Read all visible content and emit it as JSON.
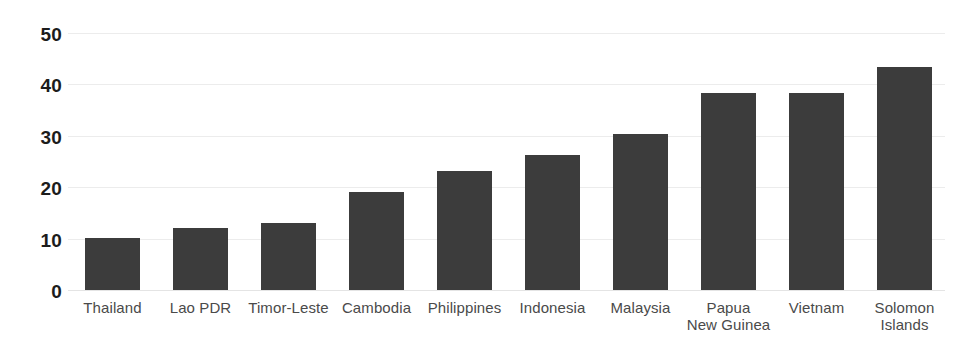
{
  "chart_data": {
    "type": "bar",
    "title": "",
    "subtitle": "",
    "xlabel": "",
    "ylabel": "",
    "ylim": [
      0,
      50
    ],
    "yticks": [
      0,
      10,
      20,
      30,
      40,
      50
    ],
    "grid": true,
    "legend": false,
    "bar_color": "#3c3c3c",
    "gridline_color": "#ececec",
    "tick_label_color": "#1c1c1c",
    "category_label_color": "#4a4a4a",
    "categories": [
      "Thailand",
      "Lao PDR",
      "Timor-Leste",
      "Cambodia",
      "Philippines",
      "Indonesia",
      "Malaysia",
      "Papua New Guinea",
      "Vietnam",
      "Solomon Islands"
    ],
    "category_lines": [
      [
        "Thailand",
        ""
      ],
      [
        "Lao PDR",
        ""
      ],
      [
        "Timor-Leste",
        ""
      ],
      [
        "Cambodia",
        ""
      ],
      [
        "Philippines",
        ""
      ],
      [
        "Indonesia",
        ""
      ],
      [
        "Malaysia",
        ""
      ],
      [
        "Papua",
        "New Guinea"
      ],
      [
        "Vietnam",
        ""
      ],
      [
        "Solomon",
        "Islands"
      ]
    ],
    "values": [
      10.1,
      12.1,
      13.0,
      19.0,
      23.2,
      26.2,
      30.3,
      38.3,
      38.3,
      43.4
    ]
  },
  "axis": {
    "y": {
      "t5": "50",
      "t4": "40",
      "t3": "30",
      "t2": "20",
      "t1": "10",
      "t0": "0"
    }
  }
}
